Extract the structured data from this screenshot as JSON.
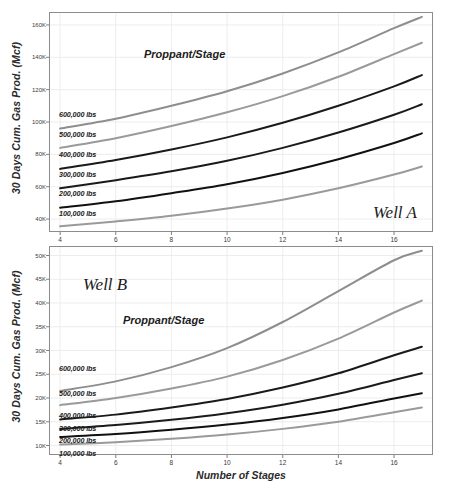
{
  "figure": {
    "width": 453,
    "height": 491,
    "background": "#ffffff"
  },
  "axis_titles": {
    "y": "30 Days Cum. Gas Prod. (Mcf)",
    "x": "Number of Stages"
  },
  "colors": {
    "line_light_gray": "#9a9a9a",
    "line_mid_gray": "#7d7d7d",
    "line_dark": "#1a1a1a",
    "line_black": "#111111",
    "frame": "#8c8c8c",
    "grid": "#e9e9e9",
    "text": "#1c1c1c"
  },
  "chart_data": [
    {
      "type": "line",
      "id": "well-a",
      "title": "Well A",
      "annotation": "Proppant/Stage",
      "xlabel": "Number of Stages",
      "ylabel": "30 Days Cum. Gas Prod. (Mcf)",
      "x": [
        4,
        6,
        8,
        10,
        12,
        14,
        16,
        17
      ],
      "xlim": [
        3.6,
        17.4
      ],
      "ylim": [
        32000,
        168000
      ],
      "xticks": [
        4,
        6,
        8,
        10,
        12,
        14,
        16
      ],
      "xticklabels": [
        "4",
        "6",
        "8",
        "10",
        "12",
        "14",
        "16"
      ],
      "yticks": [
        40000,
        60000,
        80000,
        100000,
        120000,
        140000,
        160000
      ],
      "yticklabels": [
        "40K",
        "60K",
        "80K",
        "100K",
        "120K",
        "140K",
        "160K"
      ],
      "grid": true,
      "legend_position": "inline-left",
      "series": [
        {
          "name": "600,000 lbs",
          "color": "#8e8e8e",
          "width": 2.0,
          "values": [
            96000,
            102000,
            110000,
            119000,
            130000,
            143000,
            158000,
            165000
          ]
        },
        {
          "name": "500,000 lbs",
          "color": "#9a9a9a",
          "width": 2.0,
          "values": [
            84000,
            90000,
            97500,
            106000,
            116000,
            128000,
            142000,
            149000
          ]
        },
        {
          "name": "400,000 lbs",
          "color": "#1a1a1a",
          "width": 2.0,
          "values": [
            71000,
            76500,
            83000,
            90500,
            99500,
            110000,
            122000,
            129000
          ]
        },
        {
          "name": "300,000 lbs",
          "color": "#1a1a1a",
          "width": 2.0,
          "values": [
            59000,
            64000,
            69500,
            76000,
            84000,
            93500,
            104500,
            111000
          ]
        },
        {
          "name": "200,000 lbs",
          "color": "#111111",
          "width": 2.0,
          "values": [
            47000,
            51000,
            56000,
            61500,
            68500,
            77000,
            87000,
            93000
          ]
        },
        {
          "name": "100,000 lbs",
          "color": "#9a9a9a",
          "width": 2.0,
          "values": [
            35500,
            38500,
            42000,
            46500,
            52000,
            59000,
            67500,
            72500
          ]
        }
      ]
    },
    {
      "type": "line",
      "id": "well-b",
      "title": "Well B",
      "annotation": "Proppant/Stage",
      "xlabel": "Number of Stages",
      "ylabel": "30 Days Cum. Gas Prod. (Mcf)",
      "x": [
        4,
        6,
        8,
        10,
        12,
        14,
        16,
        17
      ],
      "xlim": [
        3.6,
        17.4
      ],
      "ylim": [
        8000,
        52000
      ],
      "xticks": [
        4,
        6,
        8,
        10,
        12,
        14,
        16
      ],
      "xticklabels": [
        "4",
        "6",
        "8",
        "10",
        "12",
        "14",
        "16"
      ],
      "yticks": [
        10000,
        15000,
        20000,
        25000,
        30000,
        35000,
        40000,
        45000,
        50000
      ],
      "yticklabels": [
        "10K",
        "15K",
        "20K",
        "25K",
        "30K",
        "35K",
        "40K",
        "45K",
        "50K"
      ],
      "grid": true,
      "legend_position": "inline-left",
      "series": [
        {
          "name": "600,000 lbs",
          "color": "#8e8e8e",
          "width": 2.0,
          "values": [
            21500,
            23500,
            26500,
            30500,
            36000,
            42500,
            49000,
            51000
          ]
        },
        {
          "name": "500,000 lbs",
          "color": "#9a9a9a",
          "width": 2.0,
          "values": [
            18500,
            20000,
            22000,
            24500,
            28000,
            32500,
            38000,
            40500
          ]
        },
        {
          "name": "400,000 lbs",
          "color": "#1a1a1a",
          "width": 2.0,
          "values": [
            15500,
            16500,
            18000,
            19800,
            22200,
            25200,
            29000,
            30800
          ]
        },
        {
          "name": "300,000 lbs",
          "color": "#1a1a1a",
          "width": 2.0,
          "values": [
            13500,
            14300,
            15400,
            16800,
            18600,
            20900,
            23800,
            25200
          ]
        },
        {
          "name": "200,000 lbs",
          "color": "#111111",
          "width": 2.0,
          "values": [
            11800,
            12400,
            13300,
            14400,
            15800,
            17600,
            19900,
            21000
          ]
        },
        {
          "name": "100,000 lbs",
          "color": "#9a9a9a",
          "width": 2.0,
          "values": [
            10200,
            10700,
            11400,
            12300,
            13500,
            15000,
            17000,
            18000
          ]
        }
      ]
    }
  ],
  "panels": [
    {
      "id": "well-a",
      "plot": {
        "left": 49,
        "top": 12,
        "width": 384,
        "height": 220
      },
      "series_labels": [
        {
          "text": "600,000 lbs",
          "x": 59,
          "y": 110
        },
        {
          "text": "500,000 lbs",
          "x": 59,
          "y": 130
        },
        {
          "text": "400,000 lbs",
          "x": 59,
          "y": 150
        },
        {
          "text": "300,000 lbs",
          "x": 59,
          "y": 170
        },
        {
          "text": "200,000 lbs",
          "x": 59,
          "y": 189
        },
        {
          "text": "100,000 lbs",
          "x": 59,
          "y": 209
        }
      ],
      "annotation_pos": {
        "x": 144,
        "y": 48
      },
      "well_pos": {
        "x": 373,
        "y": 203
      }
    },
    {
      "id": "well-b",
      "plot": {
        "left": 49,
        "top": 246,
        "width": 384,
        "height": 209
      },
      "series_labels": [
        {
          "text": "600,000 lbs",
          "x": 59,
          "y": 364
        },
        {
          "text": "500,000 lbs",
          "x": 59,
          "y": 389
        },
        {
          "text": "400,000 lbs",
          "x": 59,
          "y": 411
        },
        {
          "text": "300,000 lbs",
          "x": 59,
          "y": 424
        },
        {
          "text": "200,000 lbs",
          "x": 59,
          "y": 436
        },
        {
          "text": "100,000 lbs",
          "x": 59,
          "y": 449
        }
      ],
      "annotation_pos": {
        "x": 123,
        "y": 314
      },
      "well_pos": {
        "x": 83,
        "y": 275
      }
    }
  ]
}
